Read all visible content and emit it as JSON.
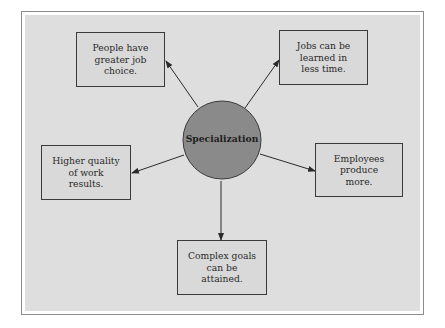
{
  "diagram": {
    "center": {
      "label": "Specialization",
      "fill": "#8a8a8a",
      "stroke": "#3a3a3a"
    },
    "nodes": [
      {
        "id": "job-choice",
        "text": "People have\ngreater job\nchoice.",
        "position": "top-left"
      },
      {
        "id": "learned-less-time",
        "text": "Jobs can be\nlearned in\nless time.",
        "position": "top-right"
      },
      {
        "id": "higher-quality",
        "text": "Higher quality\nof work\nresults.",
        "position": "left"
      },
      {
        "id": "produce-more",
        "text": "Employees\nproduce\nmore.",
        "position": "right"
      },
      {
        "id": "complex-goals",
        "text": "Complex goals\ncan be\nattained.",
        "position": "bottom"
      }
    ],
    "edges": [
      {
        "from": "Specialization",
        "to": "job-choice"
      },
      {
        "from": "Specialization",
        "to": "learned-less-time"
      },
      {
        "from": "Specialization",
        "to": "higher-quality"
      },
      {
        "from": "Specialization",
        "to": "produce-more"
      },
      {
        "from": "Specialization",
        "to": "complex-goals"
      }
    ],
    "colors": {
      "panel_background": "#dedede",
      "box_background": "#d9d9d9",
      "box_border": "#3a3a3a",
      "arrow": "#2a2a2a"
    }
  }
}
